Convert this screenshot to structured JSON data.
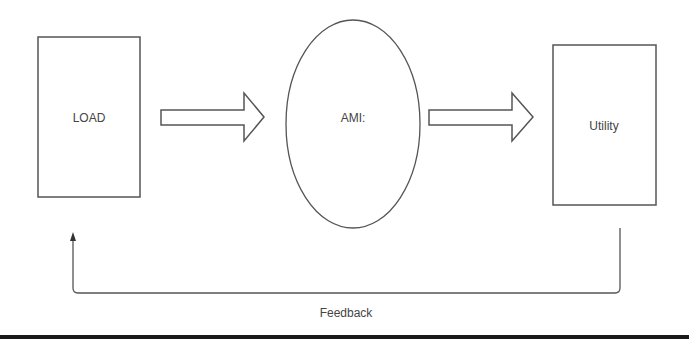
{
  "diagram": {
    "nodes": {
      "load": {
        "label": "LOAD",
        "shape": "rectangle"
      },
      "ami": {
        "label": "AMI:",
        "shape": "ellipse"
      },
      "utility": {
        "label": "Utility",
        "shape": "rectangle"
      }
    },
    "edges": [
      {
        "from": "LOAD",
        "to": "AMI:",
        "style": "block-arrow"
      },
      {
        "from": "AMI:",
        "to": "Utility",
        "style": "block-arrow"
      },
      {
        "from": "Utility",
        "to": "LOAD",
        "style": "line-arrow",
        "label": "Feedback"
      }
    ],
    "feedback_label": "Feedback",
    "colors": {
      "stroke": "#555555",
      "text": "#444444",
      "background": "#ffffff",
      "bottom_bar": "#1a1a1a"
    }
  }
}
